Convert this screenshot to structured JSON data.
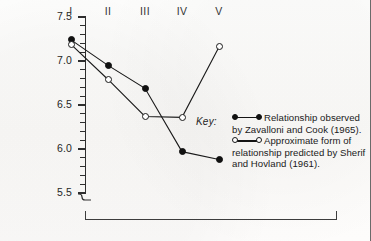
{
  "figure": {
    "background_color": "#fdfdfc",
    "ink_color": "#1a1a1a"
  },
  "legend": {
    "key_word": "Key:",
    "entries": [
      {
        "marker": "filled-circle",
        "text": "Relationship observed by Zavalloni and Cook (1965)."
      },
      {
        "marker": "open-circle",
        "text": "Approximate form of relationship predicted by Sherif and Hovland (1961)."
      }
    ]
  },
  "chart_data": {
    "type": "line",
    "title": "",
    "xlabel": "",
    "ylabel": "",
    "categories": [
      "I",
      "II",
      "III",
      "IV",
      "V"
    ],
    "ylim": [
      5.5,
      7.5
    ],
    "y_axis_broken_below": 5.5,
    "yticks_major": [
      "7.5",
      "7.0",
      "6.5",
      "6.0",
      "5.5"
    ],
    "ytick_major_values": [
      7.5,
      7.0,
      6.5,
      6.0,
      5.5
    ],
    "ytick_minor_step": 0.1,
    "grid": false,
    "legend_position": "right",
    "series": [
      {
        "name": "Relationship observed by Zavalloni and Cook (1965).",
        "marker": "filled-circle",
        "values": [
          7.24,
          6.95,
          6.69,
          5.97,
          5.88
        ]
      },
      {
        "name": "Approximate form of relationship predicted by Sherif and Hovland (1961).",
        "marker": "open-circle",
        "values": [
          7.19,
          6.79,
          6.37,
          6.36,
          7.16
        ]
      }
    ]
  }
}
